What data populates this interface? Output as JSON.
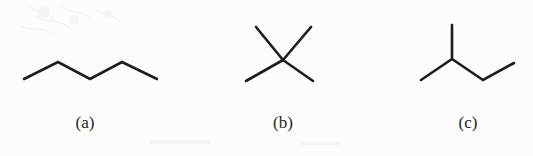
{
  "figure": {
    "background_color": "#fcfcfa",
    "stroke_color": "#1d1d1d",
    "caption_color": "#262626",
    "width": 533,
    "height": 156
  },
  "items": [
    {
      "label": "(a)",
      "name": "pentane",
      "description": "unbranched five-carbon zigzag skeletal structure",
      "vertices": [
        [
          24,
          79
        ],
        [
          58,
          62
        ],
        [
          90,
          79
        ],
        [
          122,
          62
        ],
        [
          157,
          79
        ]
      ],
      "caption_center_x": 85
    },
    {
      "label": "(b)",
      "name": "neopentane",
      "description": "quaternary carbon drawn as an X with four bonds radiating from a central point",
      "center": [
        283,
        60
      ],
      "arms": [
        [
          256,
          27
        ],
        [
          311,
          27
        ],
        [
          246,
          81
        ],
        [
          313,
          81
        ]
      ],
      "caption_center_x": 283
    },
    {
      "label": "(c)",
      "name": "2-methylbutane",
      "description": "branched chain with a methyl group pointing up from the second carbon",
      "branch_point": [
        452,
        59
      ],
      "methyl_top": [
        452,
        25
      ],
      "left_end": [
        421,
        80
      ],
      "chain": [
        [
          452,
          59
        ],
        [
          483,
          80
        ],
        [
          514,
          63
        ]
      ],
      "caption_center_x": 468
    }
  ]
}
